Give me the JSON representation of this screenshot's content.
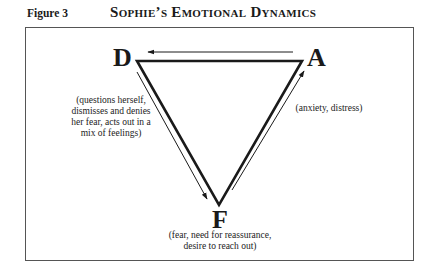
{
  "figure": {
    "label": "Figure 3",
    "title": "Sophie’s Emotional Dynamics"
  },
  "nodes": {
    "D": {
      "letter": "D",
      "description": "(questions herself, dismisses and denies her fear, acts out in a mix of feelings)"
    },
    "A": {
      "letter": "A",
      "description": "(anxiety, distress)"
    },
    "F": {
      "letter": "F",
      "description": "(fear, need for reassurance, desire to reach out)"
    }
  },
  "edges": [
    {
      "from": "A",
      "to": "D"
    },
    {
      "from": "D",
      "to": "F"
    },
    {
      "from": "F",
      "to": "A"
    }
  ],
  "colors": {
    "line": "#1a1a1a",
    "frame": "#555555"
  }
}
